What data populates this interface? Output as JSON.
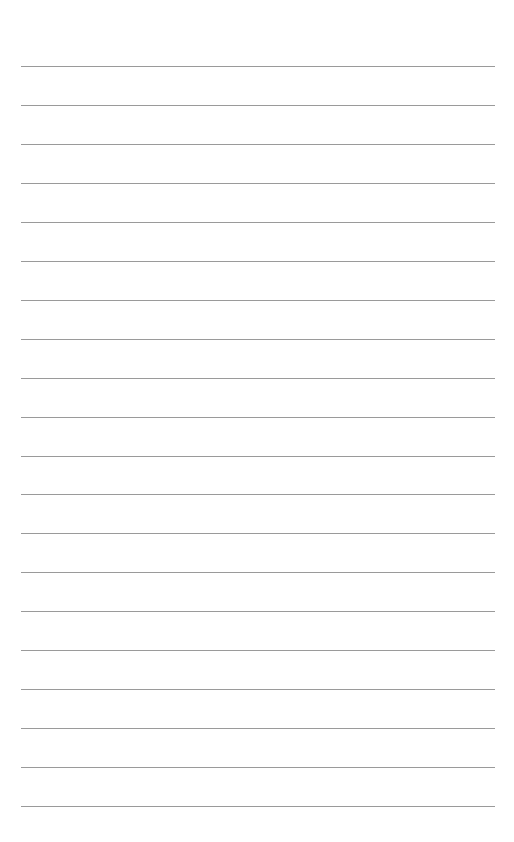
{
  "page": {
    "type": "lined-paper",
    "background_color": "#ffffff",
    "line_color": "#9a9a9a",
    "line_count": 20,
    "first_line_y": 66,
    "line_spacing": 38.95,
    "line_left_x": 21,
    "line_width": 474,
    "text": ""
  }
}
